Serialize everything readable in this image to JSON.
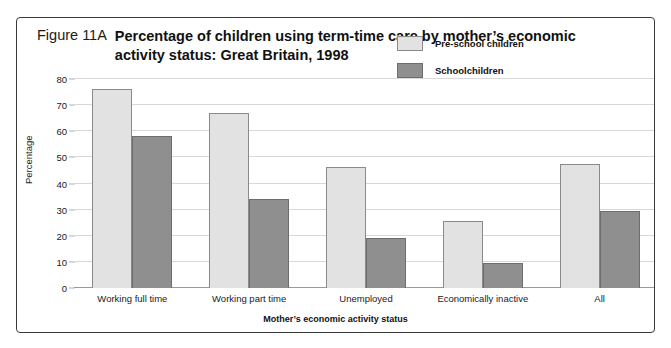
{
  "figure": {
    "number": "Figure 11A",
    "title": "Percentage of children using term-time care by mother’s economic activity status: Great Britain, 1998"
  },
  "chart_data": {
    "type": "bar",
    "title": "Percentage of children using term-time care by mother’s economic activity status: Great Britain, 1998",
    "xlabel": "Mother’s economic activity status",
    "ylabel": "Percentage",
    "ylim": [
      0,
      80
    ],
    "yticks": [
      0,
      10,
      20,
      30,
      40,
      50,
      60,
      70,
      80
    ],
    "grid": true,
    "legend_position": "top-right",
    "categories": [
      "Working full time",
      "Working part time",
      "Unemployed",
      "Economically inactive",
      "All"
    ],
    "series": [
      {
        "name": "Pre-school children",
        "color": "#e2e2e2",
        "values": [
          76,
          67,
          46.5,
          25.5,
          47.5
        ]
      },
      {
        "name": "Schoolchildren",
        "color": "#8f8f8f",
        "values": [
          58,
          34,
          19,
          9.5,
          29.5
        ]
      }
    ]
  }
}
